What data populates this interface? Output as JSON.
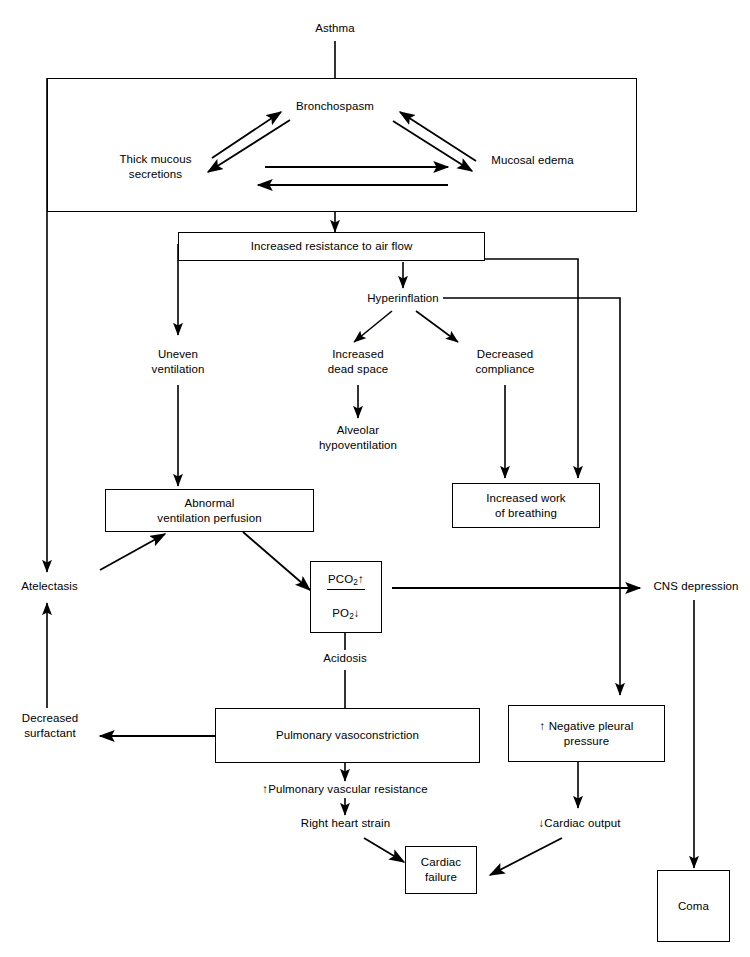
{
  "diagram": {
    "type": "flowchart",
    "stroke_color": "#000000",
    "background_color": "#ffffff"
  },
  "nodes": {
    "asthma": "Asthma",
    "bronchospasm": "Bronchospasm",
    "thick_mucous_secretions": "Thick mucous\nsecretions",
    "mucosal_edema": "Mucosal edema",
    "increased_resistance": "Increased resistance to air flow",
    "hyperinflation": "Hyperinflation",
    "uneven_ventilation": "Uneven\nventilation",
    "increased_dead_space": "Increased\ndead space",
    "decreased_compliance": "Decreased\ncompliance",
    "alveolar_hypoventilation": "Alveolar\nhypoventilation",
    "abnormal_vq": "Abnormal\nventilation perfusion",
    "increased_work_breathing": "Increased work\nof breathing",
    "atelectasis": "Atelectasis",
    "cns_depression": "CNS depression",
    "gas_numerator": "PCO2",
    "gas_numerator_arrow": "↑",
    "gas_denominator": "PO2",
    "gas_denominator_arrow": "↓",
    "acidosis": "Acidosis",
    "decreased_surfactant": "Decreased\nsurfactant",
    "pulmonary_vasoconstriction": "Pulmonary vasoconstriction",
    "negative_pleural_pressure": "↑ Negative pleural\npressure",
    "pulmonary_vascular_resistance": "↑Pulmonary vascular resistance",
    "right_heart_strain": "Right heart strain",
    "cardiac_output": "↓Cardiac output",
    "cardiac_failure": "Cardiac\nfailure",
    "coma": "Coma"
  },
  "edges": [
    {
      "from": "asthma",
      "to": "airway-obstruction-group",
      "style": "line"
    },
    {
      "from": "thick_mucous_secretions",
      "to": "bronchospasm",
      "style": "arrow"
    },
    {
      "from": "bronchospasm",
      "to": "thick_mucous_secretions",
      "style": "arrow"
    },
    {
      "from": "bronchospasm",
      "to": "mucosal_edema",
      "style": "arrow"
    },
    {
      "from": "mucosal_edema",
      "to": "bronchospasm",
      "style": "arrow"
    },
    {
      "from": "thick_mucous_secretions",
      "to": "mucosal_edema",
      "style": "arrow"
    },
    {
      "from": "mucosal_edema",
      "to": "thick_mucous_secretions",
      "style": "arrow"
    },
    {
      "from": "airway-obstruction-group",
      "to": "increased_resistance",
      "style": "arrow"
    },
    {
      "from": "increased_resistance",
      "to": "hyperinflation",
      "style": "arrow"
    },
    {
      "from": "increased_resistance",
      "to": "uneven_ventilation",
      "style": "arrow"
    },
    {
      "from": "increased_resistance",
      "to": "increased_work_breathing",
      "style": "arrow"
    },
    {
      "from": "hyperinflation",
      "to": "increased_dead_space",
      "style": "arrow"
    },
    {
      "from": "hyperinflation",
      "to": "decreased_compliance",
      "style": "arrow"
    },
    {
      "from": "hyperinflation",
      "to": "negative_pleural_pressure",
      "style": "arrow"
    },
    {
      "from": "increased_dead_space",
      "to": "alveolar_hypoventilation",
      "style": "arrow"
    },
    {
      "from": "decreased_compliance",
      "to": "increased_work_breathing",
      "style": "arrow"
    },
    {
      "from": "uneven_ventilation",
      "to": "abnormal_vq",
      "style": "arrow"
    },
    {
      "from": "abnormal_vq",
      "to": "gas_box",
      "style": "arrow"
    },
    {
      "from": "atelectasis",
      "to": "abnormal_vq",
      "style": "arrow"
    },
    {
      "from": "airway-obstruction-group",
      "to": "atelectasis",
      "style": "arrow"
    },
    {
      "from": "gas_box",
      "to": "cns_depression",
      "style": "arrow"
    },
    {
      "from": "gas_box",
      "to": "acidosis",
      "style": "line"
    },
    {
      "from": "acidosis",
      "to": "pulmonary_vasoconstriction",
      "style": "line"
    },
    {
      "from": "pulmonary_vasoconstriction",
      "to": "decreased_surfactant",
      "style": "arrow"
    },
    {
      "from": "decreased_surfactant",
      "to": "atelectasis",
      "style": "arrow"
    },
    {
      "from": "pulmonary_vasoconstriction",
      "to": "pulmonary_vascular_resistance",
      "style": "arrow"
    },
    {
      "from": "pulmonary_vascular_resistance",
      "to": "right_heart_strain",
      "style": "arrow"
    },
    {
      "from": "right_heart_strain",
      "to": "cardiac_failure",
      "style": "arrow"
    },
    {
      "from": "negative_pleural_pressure",
      "to": "cardiac_output",
      "style": "arrow"
    },
    {
      "from": "cardiac_output",
      "to": "cardiac_failure",
      "style": "arrow"
    },
    {
      "from": "cns_depression",
      "to": "coma",
      "style": "arrow"
    }
  ]
}
